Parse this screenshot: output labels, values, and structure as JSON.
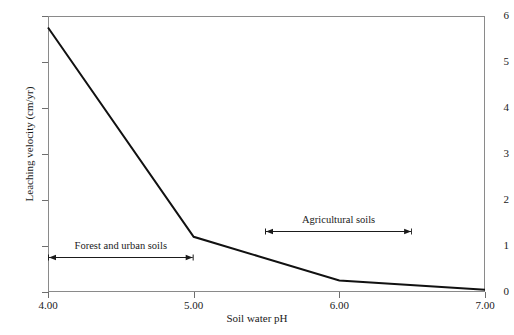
{
  "chart_data": {
    "type": "line",
    "title": "",
    "xlabel": "Soil water pH",
    "ylabel": "Leaching velocity (cm/yr)",
    "xlim": [
      4.0,
      7.0
    ],
    "ylim": [
      0,
      6
    ],
    "grid": false,
    "legend": null,
    "x": [
      4.0,
      5.0,
      6.0,
      7.0
    ],
    "values": [
      5.75,
      1.2,
      0.25,
      0.05
    ],
    "series": [
      {
        "name": "Leaching velocity",
        "x": [
          4.0,
          5.0,
          6.0,
          7.0
        ],
        "values": [
          5.75,
          1.2,
          0.25,
          0.05
        ],
        "color": "#111111"
      }
    ],
    "xticks": [
      4.0,
      5.0,
      6.0,
      7.0
    ],
    "xticklabels": [
      "4.00",
      "5.00",
      "6.00",
      "7.00"
    ],
    "yticks": [
      0,
      1,
      2,
      3,
      4,
      5,
      6
    ],
    "yticklabels": [
      "0",
      "1",
      "2",
      "3",
      "4",
      "5",
      "6"
    ],
    "annotations": [
      {
        "name": "forest-and-urban-soils",
        "text": "Forest and urban soils",
        "x_start": 4.0,
        "x_end": 5.0,
        "y": 0.73,
        "style": "double-headed-arrow"
      },
      {
        "name": "agricultural-soils",
        "text": "Agricultural soils",
        "x_start": 5.49,
        "x_end": 6.5,
        "y": 1.3,
        "style": "double-headed-arrow"
      }
    ]
  },
  "colors": {
    "background": "#ffffff",
    "line": "#111111",
    "frame": "#8a8a8a",
    "tick": "#6e6e6e",
    "text": "#1a1a1a"
  }
}
